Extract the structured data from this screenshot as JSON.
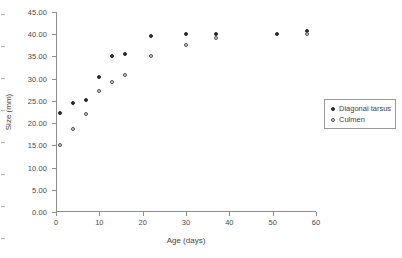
{
  "chart_data": {
    "type": "scatter",
    "title": "",
    "xlabel": "Age (days)",
    "ylabel": "Size (mm)",
    "xlim": [
      0,
      60
    ],
    "ylim": [
      0,
      45
    ],
    "xticks": [
      "0",
      "10",
      "20",
      "30",
      "40",
      "50",
      "60"
    ],
    "xtick_values": [
      0,
      10,
      20,
      30,
      40,
      50,
      60
    ],
    "yticks": [
      "0.00",
      "5.00",
      "10.00",
      "15.00",
      "20.00",
      "25.00",
      "30.00",
      "35.00",
      "40.00",
      "45.00"
    ],
    "ytick_values": [
      0,
      5,
      10,
      15,
      20,
      25,
      30,
      35,
      40,
      45
    ],
    "grid": false,
    "legend_position": "right",
    "series": [
      {
        "name": "Diagonal tarsus",
        "marker": "filled-circle",
        "color": "#2b2b2b",
        "x": [
          1,
          4,
          7,
          10,
          13,
          16,
          22,
          30,
          37,
          51,
          58
        ],
        "y": [
          22.2,
          24.5,
          25.1,
          30.3,
          35.0,
          35.6,
          39.7,
          40.1,
          40.1,
          40.1,
          40.8
        ]
      },
      {
        "name": "Culmen",
        "marker": "open-circle",
        "color": "#4a4a4a",
        "x": [
          1,
          4,
          7,
          10,
          13,
          16,
          22,
          30,
          37,
          58
        ],
        "y": [
          15.1,
          18.7,
          22.1,
          27.2,
          29.3,
          30.8,
          35.2,
          37.5,
          39.2,
          40.1
        ]
      }
    ]
  },
  "legend": {
    "items": [
      {
        "label": "Diagonal tarsus",
        "marker": "filled-circle"
      },
      {
        "label": "Culmen",
        "marker": "open-circle"
      }
    ]
  }
}
